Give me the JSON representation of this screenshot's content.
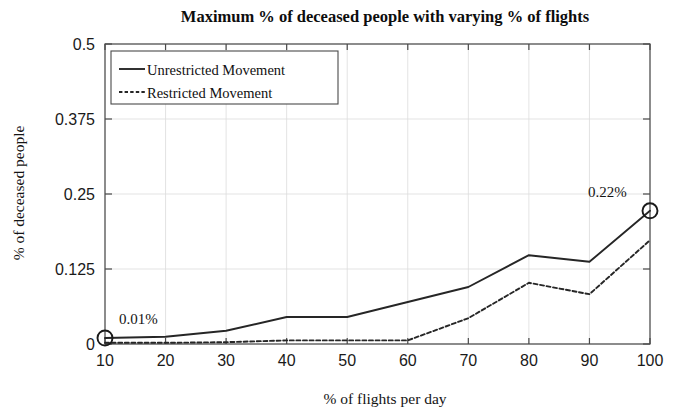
{
  "figure": {
    "background_color": "#ffffff",
    "line_color": "#262626",
    "axis_color": "#4a4a4a",
    "grid_color": "#dcdcdc"
  },
  "chart_data": {
    "type": "line",
    "title": "Maximum % of deceased people with varying % of flights",
    "xlabel": "% of flights per day",
    "ylabel": "% of deceased people",
    "x": [
      10,
      20,
      30,
      40,
      50,
      60,
      70,
      80,
      90,
      100
    ],
    "xticks": [
      "10",
      "20",
      "30",
      "40",
      "50",
      "60",
      "70",
      "80",
      "90",
      "100"
    ],
    "yticks": [
      "0",
      "0.125",
      "0.25",
      "0.375",
      "0.5"
    ],
    "ytick_values": [
      0,
      0.125,
      0.25,
      0.375,
      0.5
    ],
    "xlim": [
      10,
      100
    ],
    "ylim": [
      0,
      0.5
    ],
    "grid": true,
    "legend_position": "top-left",
    "series": [
      {
        "name": "Unrestricted Movement",
        "style": "solid",
        "values": [
          0.01,
          0.012,
          0.022,
          0.045,
          0.045,
          0.07,
          0.095,
          0.148,
          0.137,
          0.222
        ]
      },
      {
        "name": "Restricted Movement",
        "style": "dashed",
        "values": [
          0.002,
          0.002,
          0.003,
          0.006,
          0.006,
          0.006,
          0.043,
          0.102,
          0.083,
          0.173
        ]
      }
    ],
    "annotations": [
      {
        "label": "0.01%",
        "x": 10,
        "y": 0.01,
        "marker": "circle",
        "label_offset_x": 14,
        "label_offset_y": -14
      },
      {
        "label": "0.22%",
        "x": 100,
        "y": 0.222,
        "marker": "circle",
        "label_offset_x": -62,
        "label_offset_y": -14
      }
    ]
  }
}
